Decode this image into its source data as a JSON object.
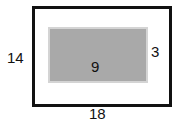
{
  "diagram": {
    "outer_rect": {
      "height_label": "14",
      "width_label": "18",
      "border_color": "#111111",
      "fill": "#ffffff"
    },
    "inner_rect": {
      "area_label": "9",
      "margin_label": "3",
      "fill": "#a9a9a9",
      "border_color": "#d4d4d4"
    }
  }
}
